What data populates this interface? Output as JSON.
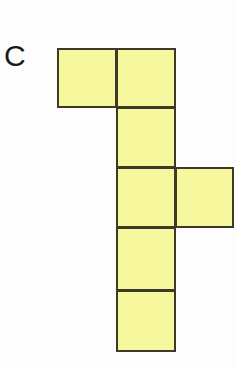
{
  "figure": {
    "label": "C",
    "kind": "cube-net-hexomino",
    "background_color": "#fdfdfd",
    "fill_color": "#f7f79e",
    "stroke_color": "#3b3b27",
    "stroke_width_px": 2,
    "label_color": "#1a1a1a",
    "grid": {
      "origin_x": 57,
      "origin_y": 48,
      "cell_width": 60,
      "cell_height": 60,
      "columns": 3,
      "rows": 5,
      "column_edges_x": [
        57,
        117,
        176,
        235
      ],
      "row_edges_y": [
        48,
        108,
        168,
        228,
        291,
        352
      ]
    },
    "squares": [
      {
        "name": "square-r0c0",
        "row": 0,
        "col": 0,
        "x": 57,
        "y": 48,
        "w": 60,
        "h": 60
      },
      {
        "name": "square-r0c1",
        "row": 0,
        "col": 1,
        "x": 116,
        "y": 48,
        "w": 60,
        "h": 60
      },
      {
        "name": "square-r1c1",
        "row": 1,
        "col": 1,
        "x": 116,
        "y": 107,
        "w": 60,
        "h": 61
      },
      {
        "name": "square-r2c1",
        "row": 2,
        "col": 1,
        "x": 116,
        "y": 167,
        "w": 60,
        "h": 61
      },
      {
        "name": "square-r2c2",
        "row": 2,
        "col": 2,
        "x": 175,
        "y": 167,
        "w": 59,
        "h": 61
      },
      {
        "name": "square-r3c1",
        "row": 3,
        "col": 1,
        "x": 116,
        "y": 227,
        "w": 60,
        "h": 64
      },
      {
        "name": "square-r4c1",
        "row": 4,
        "col": 1,
        "x": 116,
        "y": 290,
        "w": 60,
        "h": 62
      }
    ]
  }
}
